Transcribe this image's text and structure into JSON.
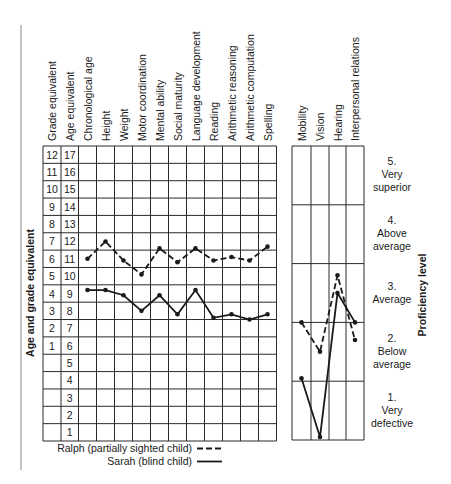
{
  "chart_data": [
    {
      "type": "line",
      "title": "Age and grade equivalent profile",
      "ylabel": "Age and grade equivalent",
      "xlabel": "",
      "grade_equivalent_header": "Grade equivalent",
      "age_equivalent_header": "Age equivalent",
      "age_ticks": [
        17,
        16,
        15,
        14,
        13,
        12,
        11,
        10,
        9,
        8,
        7,
        6,
        5,
        4,
        3,
        2,
        1
      ],
      "grade_ticks": [
        "12",
        "11",
        "10",
        "9",
        "8",
        "7",
        "6",
        "5",
        "4",
        "3",
        "2",
        "1",
        "",
        "",
        "",
        "",
        ""
      ],
      "ylim": [
        1,
        17
      ],
      "grid": true,
      "categories": [
        "Chronological age",
        "Height",
        "Weight",
        "Motor coordination",
        "Mental ability",
        "Social maturity",
        "Language development",
        "Reading",
        "Arithmetic reasoning",
        "Arithmetic computation",
        "Spelling"
      ],
      "series": [
        {
          "name": "Ralph (partially sighted child)",
          "style": "dashed",
          "values": [
            11.0,
            12.0,
            10.9,
            10.1,
            11.6,
            10.8,
            11.6,
            10.9,
            11.1,
            10.9,
            11.7
          ]
        },
        {
          "name": "Sarah (blind child)",
          "style": "solid",
          "values": [
            9.2,
            9.2,
            8.9,
            8.0,
            8.9,
            7.8,
            9.2,
            7.6,
            7.8,
            7.5,
            7.8
          ]
        }
      ]
    },
    {
      "type": "line",
      "title": "Proficiency level profile",
      "ylabel": "Proficiency level",
      "xlabel": "",
      "ylim": [
        0.5,
        5.5
      ],
      "grid": true,
      "categories": [
        "Mobility",
        "Vision",
        "Hearing",
        "Interpersonal relations"
      ],
      "levels": [
        {
          "num": "5.",
          "line1": "Very",
          "line2": "superior"
        },
        {
          "num": "4.",
          "line1": "Above",
          "line2": "average"
        },
        {
          "num": "3.",
          "line1": "Average",
          "line2": ""
        },
        {
          "num": "2.",
          "line1": "Below",
          "line2": "average"
        },
        {
          "num": "1.",
          "line1": "Very",
          "line2": "defective"
        }
      ],
      "series": [
        {
          "name": "Ralph (partially sighted child)",
          "style": "dashed",
          "values": [
            2.5,
            2.0,
            3.3,
            2.2
          ]
        },
        {
          "name": "Sarah (blind child)",
          "style": "solid",
          "values": [
            1.55,
            0.55,
            3.0,
            2.5
          ]
        }
      ]
    }
  ],
  "legend": [
    {
      "label": "Ralph (partially sighted child)",
      "style": "dashed"
    },
    {
      "label": "Sarah (blind child)",
      "style": "solid"
    }
  ],
  "colors": {
    "ink": "#1a1a1a",
    "grid": "#2a2a2a",
    "margin_rule": "#9a9a9a"
  }
}
